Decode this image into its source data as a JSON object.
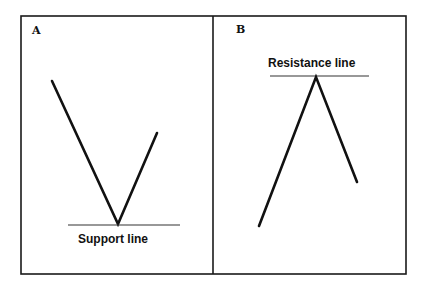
{
  "panels": [
    {
      "id": "A",
      "label": "A",
      "pattern": "V-shaped bounce off support",
      "level_label": "Support line"
    },
    {
      "id": "B",
      "label": "B",
      "pattern": "inverted-V reversal at resistance",
      "level_label": "Resistance line"
    }
  ],
  "colors": {
    "line": "#111111",
    "background": "#ffffff"
  }
}
